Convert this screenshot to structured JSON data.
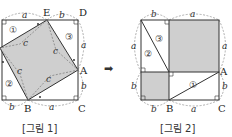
{
  "figure1": {
    "caption": "[그림 1]",
    "points": {
      "E": "E",
      "D": "D",
      "A": "A",
      "B": "B",
      "C": "C"
    },
    "side_labels": {
      "top_a": "a",
      "top_b": "b",
      "right_a": "a",
      "right_b": "b",
      "bottom_b": "b",
      "bottom_a": "a"
    },
    "hyp_labels": [
      "c",
      "c",
      "c",
      "c"
    ],
    "regions": [
      "①",
      "②",
      "③"
    ]
  },
  "figure2": {
    "caption": "[그림 2]",
    "points": {
      "A": "A",
      "B": "B",
      "C": "C"
    },
    "side_labels": {
      "top_b": "b",
      "top_a": "a",
      "left_a": "a",
      "right_a": "a",
      "left_b": "b",
      "right_b": "b",
      "bottom_b": "b",
      "bottom_a": "a"
    },
    "regions": [
      "①",
      "②",
      "③"
    ]
  },
  "arrow": "➡",
  "colors": {
    "shade": "#cfcfcf",
    "line": "#333333",
    "dash": "#9a9a9a"
  }
}
